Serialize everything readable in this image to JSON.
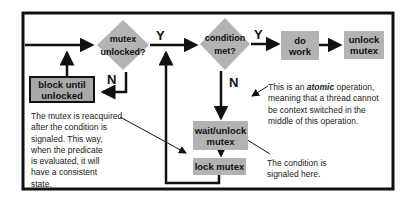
{
  "diagram": {
    "nodes": {
      "mutex_unlocked": {
        "line1": "mutex",
        "line2": "unlocked?",
        "shape": "diamond"
      },
      "condition_met": {
        "line1": "condition",
        "line2": "met?",
        "shape": "diamond"
      },
      "do_work": {
        "line1": "do",
        "line2": "work",
        "shape": "box"
      },
      "unlock_mutex": {
        "line1": "unlock",
        "line2": "mutex",
        "shape": "box"
      },
      "block_until_unlocked": {
        "line1": "block until",
        "line2": "unlocked",
        "shape": "box"
      },
      "wait_unlock_mutex": {
        "line1": "wait/unlock",
        "line2": "mutex",
        "shape": "box"
      },
      "lock_mutex": {
        "label": "lock mutex",
        "shape": "box"
      }
    },
    "edge_labels": {
      "mutex_yes": "Y",
      "mutex_no": "N",
      "condition_yes": "Y",
      "condition_no": "N"
    },
    "notes": {
      "atomic": {
        "prefix": "This is an ",
        "emphasis": "atomic",
        "suffix": " operation,",
        "line2": "meaning that a thread cannot",
        "line3": "be context switched in the",
        "line4": "middle of this operation."
      },
      "reacquire": {
        "line1": "The mutex is reacquired",
        "line2": "after the condition is",
        "line3": "signaled. This way,",
        "line4": "when the predicate",
        "line5": "is evaluated, it will",
        "line6": "have a consistent",
        "line7": "state."
      },
      "signaled": {
        "line1": "The condition is",
        "line2": "signaled here."
      }
    },
    "colors": {
      "node_fill": "#b3b3b3",
      "line": "#111111",
      "background": "#ffffff"
    }
  }
}
